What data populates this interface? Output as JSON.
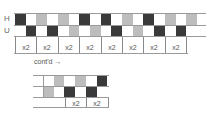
{
  "rows": {
    "top_label": "H",
    "bottom_label": "U"
  },
  "colors": {
    "dark": "#3a3a3a",
    "light": "#bdbdbd",
    "white": "#ffffff"
  },
  "main_chart": {
    "h_row": [
      "dark",
      "white",
      "light",
      "white",
      "light",
      "white",
      "dark",
      "white",
      "dark",
      "white",
      "light",
      "white",
      "dark",
      "white",
      "light",
      "white",
      "light"
    ],
    "u_row": [
      "white",
      "dark",
      "white",
      "dark",
      "white",
      "light",
      "white",
      "light",
      "white",
      "dark",
      "white",
      "light",
      "white",
      "dark",
      "white",
      "dark",
      "white"
    ],
    "repeat_labels": [
      "x2",
      "x2",
      "x2",
      "x2",
      "x2",
      "x2",
      "x2",
      "x2"
    ]
  },
  "continued_chart": {
    "label": "cont'd",
    "arrow": "→",
    "h_row": [
      "white",
      "light",
      "white",
      "light",
      "white",
      "dark"
    ],
    "u_row": [
      "light",
      "white",
      "dark",
      "white",
      "dark",
      "white"
    ],
    "repeat_labels": [
      "x2",
      "x2"
    ]
  }
}
